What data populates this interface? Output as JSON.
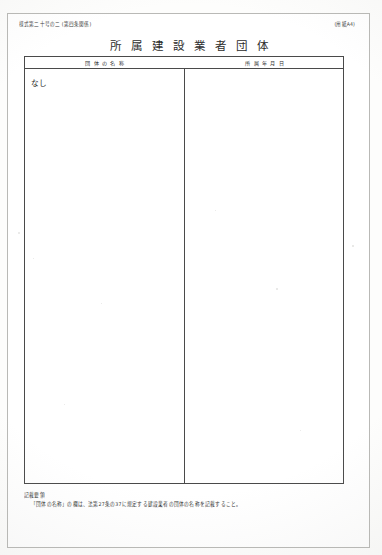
{
  "document": {
    "form_code": "様式第二十号の二 (第四条関係)",
    "paper_size": "(用紙A4)",
    "title": "所属建設業者団体"
  },
  "table": {
    "columns": [
      {
        "header": "団体の名称"
      },
      {
        "header": "所属年月日"
      }
    ],
    "rows": [
      {
        "organization_name": "なし",
        "affiliation_date": ""
      }
    ]
  },
  "notes": {
    "heading": "記載要領",
    "items": [
      "「団体の名称」の欄は、法第27条の37に規定する建設業者の団体の名称を記載すること。"
    ]
  }
}
